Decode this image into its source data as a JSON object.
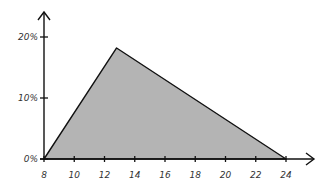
{
  "chart_data": {
    "type": "area",
    "title": "",
    "xlabel": "",
    "ylabel": "",
    "x": [
      8,
      12.8,
      24
    ],
    "values": [
      0,
      18.2,
      0
    ],
    "xlim": [
      8,
      24
    ],
    "ylim": [
      0,
      20
    ],
    "x_ticks": [
      "8",
      "10",
      "12",
      "14",
      "16",
      "18",
      "20",
      "22",
      "24"
    ],
    "y_ticks": [
      "0%",
      "10%",
      "20%"
    ],
    "grid": false,
    "legend": null,
    "style": "hand-drawn triangular distribution, gray fill with black outline"
  },
  "colors": {
    "fill": "#b4b4b4",
    "stroke": "#111111",
    "axis": "#111111",
    "text": "#333333"
  }
}
